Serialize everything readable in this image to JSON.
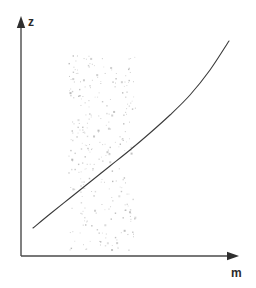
{
  "figure": {
    "title": "",
    "background_color": "#ffffff",
    "width": 256,
    "height": 288
  },
  "axes": {
    "vertical": {
      "name": "z-axis",
      "label": "z",
      "label_x": 28,
      "label_y": 26,
      "x": 21,
      "y_top": 18,
      "y_bottom": 256,
      "color": "#4a4a4a",
      "arrow": "up-arrow"
    },
    "horizontal": {
      "name": "m-axis",
      "label": "m",
      "label_x": 231,
      "label_y": 277,
      "y": 256,
      "x_left": 21,
      "x_right": 237,
      "color": "#4a4a4a",
      "arrow": "right-arrow"
    }
  },
  "chart_data": {
    "type": "line",
    "title": "",
    "xlabel": "m",
    "ylabel": "z",
    "grid": false,
    "legend": null,
    "curve": {
      "name": "monotonic-increasing-convex-curve",
      "color": "#3a3a3a",
      "stroke_width": 1.1,
      "points": [
        [
          33,
          228
        ],
        [
          50,
          214
        ],
        [
          70,
          198
        ],
        [
          90,
          182
        ],
        [
          110,
          166
        ],
        [
          130,
          150
        ],
        [
          150,
          133
        ],
        [
          170,
          115
        ],
        [
          190,
          95
        ],
        [
          210,
          70
        ],
        [
          229,
          41
        ]
      ]
    },
    "shaded_band": {
      "name": "stippled-uncertainty-band",
      "style": "random-dot-stipple",
      "x_start": 68,
      "x_end": 135,
      "y_top": 55,
      "y_bottom": 250,
      "dot_color": "#b9b9b9",
      "dot_count": 300
    }
  }
}
